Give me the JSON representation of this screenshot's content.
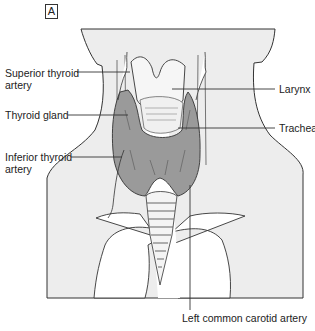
{
  "figure": {
    "panel_label": "A",
    "colors": {
      "skin": "#ededed",
      "outline": "#333333",
      "gland": "#9a9a9a",
      "vessel": "#ffffff",
      "background": "#ffffff"
    }
  },
  "labels": {
    "superior_thyroid_artery_l1": "Superior thyroid",
    "superior_thyroid_artery_l2": "artery",
    "thyroid_gland": "Thyroid gland",
    "inferior_thyroid_artery_l1": "Inferior thyroid",
    "inferior_thyroid_artery_l2": "artery",
    "larynx": "Larynx",
    "trachea": "Trachea",
    "left_common_carotid_artery": "Left common carotid artery"
  }
}
